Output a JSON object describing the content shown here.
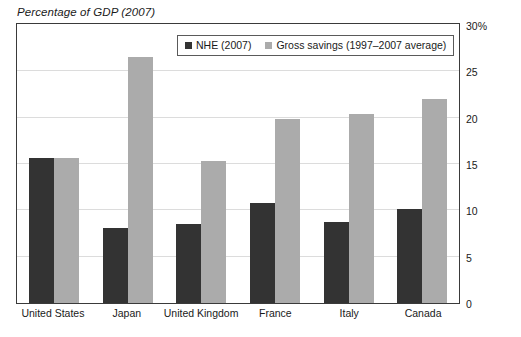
{
  "chart_data": {
    "type": "bar",
    "title": "Percentage of GDP (2007)",
    "xlabel": "",
    "ylabel": "",
    "ylim": [
      0,
      30
    ],
    "yticks": [
      0,
      5,
      10,
      15,
      20,
      25,
      30
    ],
    "ytick_labels": [
      "0",
      "5",
      "10",
      "15",
      "20",
      "25",
      "30%"
    ],
    "grid": true,
    "legend_position": "top-center",
    "categories": [
      "United States",
      "Japan",
      "United Kingdom",
      "France",
      "Italy",
      "Canada"
    ],
    "series": [
      {
        "name": "NHE (2007)",
        "color": "#333333",
        "values": [
          15.6,
          8.1,
          8.5,
          10.8,
          8.7,
          10.1
        ]
      },
      {
        "name": "Gross savings (1997–2007 average)",
        "color": "#ababab",
        "values": [
          15.7,
          26.6,
          15.3,
          19.9,
          20.4,
          22.0
        ]
      }
    ]
  },
  "colors": {
    "series_nhe": "#333333",
    "series_savings": "#ababab",
    "frame": "#3a3a3a",
    "gridline": "#dcdcdc",
    "background": "#ffffff"
  }
}
